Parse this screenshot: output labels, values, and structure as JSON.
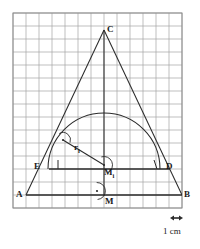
{
  "figure": {
    "grid": {
      "cell_size_px": 13,
      "columns": 13,
      "rows": 15,
      "left": 13,
      "top": 13,
      "right": 182,
      "bottom": 208,
      "line_color": "#9a9a9a",
      "background": "#ffffff"
    },
    "stroke_color": "#2b2b2b",
    "points": {
      "A": {
        "label": "A",
        "x": 26,
        "y": 195,
        "label_x": 16,
        "label_y": 190
      },
      "B": {
        "label": "B",
        "x": 182,
        "y": 195,
        "label_x": 184,
        "label_y": 190
      },
      "C": {
        "label": "C",
        "x": 104,
        "y": 30,
        "label_x": 107,
        "label_y": 25
      },
      "D": {
        "label": "D",
        "x": 156,
        "y": 169,
        "label_x": 166,
        "label_y": 162
      },
      "E": {
        "label": "E",
        "x": 52,
        "y": 169,
        "label_x": 34,
        "label_y": 162
      },
      "M": {
        "label": "M",
        "x": 104,
        "y": 195,
        "label_x": 105,
        "label_y": 197
      },
      "Mi": {
        "label": "M",
        "sub": "i",
        "x": 104,
        "y": 165,
        "label_x": 104,
        "label_y": 168
      }
    },
    "radius_label": {
      "text": "r",
      "sub": "i",
      "x": 74,
      "y": 143
    },
    "tangent_point": {
      "x": 63,
      "y": 140
    },
    "semicircle": {
      "cx": 104,
      "cy": 169,
      "r": 56,
      "peak_y": 113
    },
    "right_angle_marks": [
      {
        "name": "right-angle-at-tangent",
        "cx": 63,
        "cy": 140
      },
      {
        "name": "right-angle-at-Mi",
        "cx": 104,
        "cy": 165
      },
      {
        "name": "right-angle-at-M",
        "cx": 97,
        "cy": 191
      }
    ],
    "scale": {
      "caption": "1 cm",
      "caption_x": 163,
      "caption_y": 227,
      "arrow_x1": 170,
      "arrow_x2": 183,
      "arrow_y": 218
    }
  }
}
